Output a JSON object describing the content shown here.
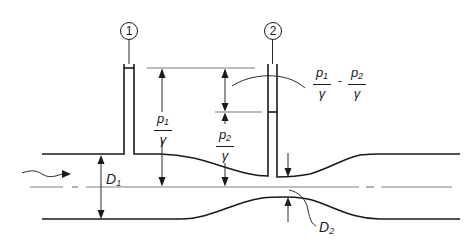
{
  "diagram": {
    "type": "venturi-meter",
    "stations": [
      {
        "id": "station-1",
        "label": "1"
      },
      {
        "id": "station-2",
        "label": "2"
      }
    ],
    "labels": {
      "p1_over_gamma": {
        "num": "p",
        "num_sub": "1",
        "den": "γ"
      },
      "p2_over_gamma": {
        "num": "p",
        "num_sub": "2",
        "den": "γ"
      },
      "head_difference": {
        "left": {
          "num": "p",
          "num_sub": "1",
          "den": "γ"
        },
        "operator": "-",
        "right": {
          "num": "p",
          "num_sub": "2",
          "den": "γ"
        }
      },
      "D1": {
        "main": "D",
        "sub": "1"
      },
      "D2": {
        "main": "D",
        "sub": "2"
      }
    },
    "colors": {
      "line": "#1a1a1a",
      "leader": "#7a7a7a",
      "centerline": "#808080",
      "background": "#ffffff"
    }
  }
}
